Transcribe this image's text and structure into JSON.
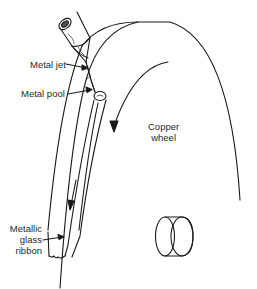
{
  "diagram": {
    "type": "melt-spinning process illustration",
    "labels": {
      "metal_jet": "Metal jet",
      "metal_pool": "Metal pool",
      "copper_wheel_line1": "Copper",
      "copper_wheel_line2": "wheel",
      "ribbon_line1": "Metallic",
      "ribbon_line2": "glass",
      "ribbon_line3": "ribbon"
    },
    "components": [
      {
        "name": "crucible",
        "description": "Nozzle/crucible pouring molten metal"
      },
      {
        "name": "metal-jet",
        "description": "Stream of molten metal"
      },
      {
        "name": "metal-pool",
        "description": "Puddle on wheel rim"
      },
      {
        "name": "copper-wheel",
        "description": "Rotating copper wheel with rotation arrow"
      },
      {
        "name": "ribbon",
        "description": "Metallic glass ribbon leaving the wheel, with direction arrow"
      },
      {
        "name": "hub",
        "description": "Wheel axle/hub cylinder"
      }
    ],
    "colors": {
      "line": "#1a1a1a",
      "text": "#2a2a2a",
      "background": "#ffffff"
    }
  }
}
